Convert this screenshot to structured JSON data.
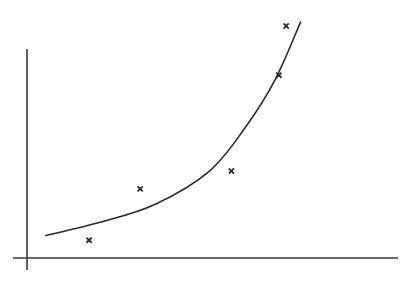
{
  "chart_data": {
    "type": "scatter",
    "title": "",
    "xlabel": "",
    "ylabel": "",
    "grid": false,
    "legend": null,
    "axis_ranges": {
      "x": [
        0,
        10
      ],
      "y": [
        0,
        10
      ]
    },
    "series": [
      {
        "name": "observed points",
        "kind": "scatter",
        "marker": "x",
        "x": [
          1.7,
          3.1,
          5.6,
          6.9,
          7.1
        ],
        "y": [
          0.8,
          3.1,
          3.9,
          8.2,
          10.4
        ]
      },
      {
        "name": "fitted curve",
        "kind": "line",
        "shape": "exponential",
        "x": [
          0.5,
          2.0,
          3.5,
          5.0,
          6.0,
          6.8,
          7.5
        ],
        "y": [
          1.0,
          1.6,
          2.4,
          3.9,
          5.9,
          8.0,
          10.6
        ]
      }
    ]
  },
  "colors": {
    "ink": "#2a2a2a",
    "background": "#ffffff"
  }
}
